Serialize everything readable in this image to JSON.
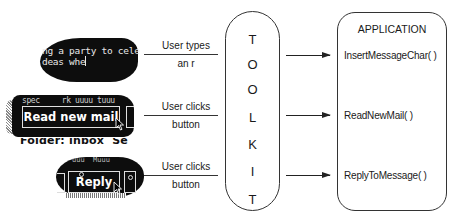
{
  "diagram": {
    "toolkit": {
      "label_letters": [
        "T",
        "O",
        "O",
        "L",
        "K",
        "I",
        "T"
      ]
    },
    "application": {
      "title": "APPLICATION",
      "functions": [
        "InsertMessageChar( )",
        "ReadNewMail( )",
        "ReplyToMessage( )"
      ]
    },
    "rows": [
      {
        "widget": "text-field",
        "widget_text_line1": "ng a party to cele",
        "widget_text_line2": "deas whe",
        "event_top": "User types",
        "event_bottom": "an r",
        "callback": "InsertMessageChar( )"
      },
      {
        "widget": "button",
        "widget_top_text": "spec     rk uuuu tuuu",
        "button_label": "Read new mail",
        "widget_bottom_text": "Folder: inbox  Se",
        "event_top": "User clicks",
        "event_bottom": "button",
        "callback": "ReadNewMail( )"
      },
      {
        "widget": "button",
        "widget_top_text": "uuu  Muuu",
        "button_label": "Reply",
        "event_top": "User clicks",
        "event_bottom": "button",
        "callback": "ReplyToMessage( )"
      }
    ],
    "colors": {
      "line": "#333333",
      "blob": "#0d0d0d",
      "text": "#1a1a1a",
      "background": "#ffffff"
    }
  }
}
